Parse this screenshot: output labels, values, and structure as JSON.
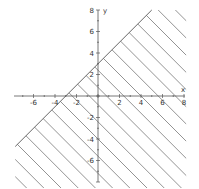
{
  "chart_data": {
    "type": "inequality-region",
    "title": "",
    "xlabel": "x",
    "ylabel": "y",
    "xlim": [
      -8,
      8
    ],
    "ylim": [
      -8,
      8
    ],
    "grid": false,
    "x_ticks": [
      -6,
      -4,
      -2,
      2,
      4,
      6,
      8
    ],
    "y_ticks": [
      8,
      6,
      4,
      2,
      -2,
      -4,
      -6
    ],
    "x_tick_labels": [
      "-6",
      "-4",
      "-2",
      "2",
      "4",
      "6",
      "8"
    ],
    "y_tick_labels": [
      "8",
      "6",
      "4",
      "2",
      "-2",
      "-4",
      "-6"
    ],
    "boundary": {
      "equation": "y = x + 3",
      "slope": 1,
      "intercept": 3,
      "style": "solid"
    },
    "inequality": "y < x + 3",
    "shaded_side": "below-right",
    "shading": "diagonal hatch"
  },
  "colors": {
    "axis": "#555555",
    "boundary": "#666666",
    "hatch": "#777777",
    "text": "#333333",
    "background": "#ffffff"
  }
}
